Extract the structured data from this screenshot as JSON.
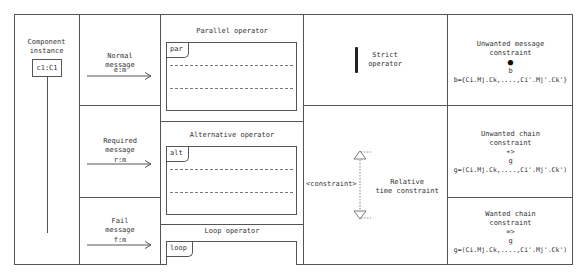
{
  "component": {
    "title_line1": "Component",
    "title_line2": "instance",
    "instance_label": "c1:C1"
  },
  "messages": [
    {
      "line1": "Normal",
      "line2": "message",
      "label": "e:m"
    },
    {
      "line1": "Required",
      "line2": "message",
      "label": "r:m"
    },
    {
      "line1": "Fail",
      "line2": "message",
      "label": "f:m"
    }
  ],
  "operators": [
    {
      "title": "Parallel operator",
      "tag": "par"
    },
    {
      "title": "Alternative operator",
      "tag": "alt"
    },
    {
      "title": "Loop operator",
      "tag": "loop"
    }
  ],
  "strict": {
    "line1": "Strict",
    "line2": "operator"
  },
  "time_constraint": {
    "constraint_label": "<constraint>",
    "line1": "Relative",
    "line2": "time constraint"
  },
  "constraints": [
    {
      "line1": "Unwanted message",
      "line2": "constraint",
      "symbol": "●",
      "var": "b",
      "formula": "b={Ci.Mj.Ck,....,Ci'.Mj'.Ck'}"
    },
    {
      "line1": "Unwanted chain",
      "line2": "constraint",
      "symbol": "≁>",
      "var": "g",
      "formula": "g=(Ci.Mj.Ck,....,Ci'.Mj'.Ck')"
    },
    {
      "line1": "Wanted chain",
      "line2": "constraint",
      "symbol": "=>",
      "var": "g",
      "formula": "g=(Ci.Mj.Ck,....,Ci'.Mj'.Ck')"
    }
  ]
}
